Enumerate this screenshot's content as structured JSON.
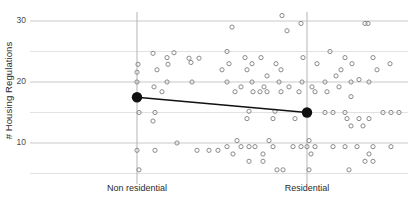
{
  "chart_data": {
    "type": "scatter",
    "title": "",
    "xlabel": "",
    "ylabel": "# Housing Regulations",
    "categories": [
      "Non residential",
      "Residential"
    ],
    "ylim": [
      3,
      32
    ],
    "yticks": [
      10,
      20,
      30
    ],
    "ytick_labels": [
      "10",
      "20",
      "30"
    ],
    "minor_gridlines": [
      5,
      15,
      25
    ],
    "grid": true,
    "legend": "none",
    "marker_style": "open-circle",
    "mean_marker_style": "filled-circle",
    "mean_line": {
      "label": "mean connector",
      "color": "#111111",
      "from": {
        "category": "Non residential",
        "value": 17.5
      },
      "to": {
        "category": "Residential",
        "value": 15.0
      }
    },
    "series": [
      {
        "name": "Non residential",
        "category_center_x": 137,
        "mean": 17.5,
        "points": [
          {
            "jx": 95,
            "y": 29.0
          },
          {
            "jx": 37,
            "y": 24.8
          },
          {
            "jx": 30,
            "y": 24.0
          },
          {
            "jx": 16,
            "y": 24.7
          },
          {
            "jx": 52,
            "y": 23.9
          },
          {
            "jx": 62,
            "y": 23.9
          },
          {
            "jx": 54,
            "y": 23.2
          },
          {
            "jx": 31,
            "y": 22.9
          },
          {
            "jx": 1,
            "y": 22.9
          },
          {
            "jx": 20,
            "y": 22.0
          },
          {
            "jx": 0,
            "y": 21.6
          },
          {
            "jx": 0,
            "y": 20.0
          },
          {
            "jx": 30,
            "y": 20.0
          },
          {
            "jx": 55,
            "y": 20.0
          },
          {
            "jx": 17,
            "y": 19.2
          },
          {
            "jx": 25,
            "y": 18.4
          },
          {
            "jx": 2,
            "y": 15.0
          },
          {
            "jx": 18,
            "y": 15.0
          },
          {
            "jx": 16,
            "y": 13.6
          },
          {
            "jx": 40,
            "y": 10.0
          },
          {
            "jx": 18,
            "y": 8.8
          },
          {
            "jx": 0,
            "y": 8.8
          },
          {
            "jx": 60,
            "y": 8.8
          },
          {
            "jx": 72,
            "y": 8.8
          },
          {
            "jx": 81,
            "y": 8.8
          },
          {
            "jx": 2,
            "y": 5.6
          }
        ]
      },
      {
        "name": "Residential",
        "category_center_x": 307,
        "mean": 15.0,
        "points": [
          {
            "jx": -25,
            "y": 30.9
          },
          {
            "jx": -6,
            "y": 29.6
          },
          {
            "jx": 58,
            "y": 29.6
          },
          {
            "jx": 61,
            "y": 29.6
          },
          {
            "jx": -20,
            "y": 28.4
          },
          {
            "jx": -80,
            "y": 25.0
          },
          {
            "jx": 23,
            "y": 25.0
          },
          {
            "jx": -62,
            "y": 24.0
          },
          {
            "jx": -46,
            "y": 24.0
          },
          {
            "jx": -4,
            "y": 24.0
          },
          {
            "jx": 38,
            "y": 24.0
          },
          {
            "jx": 66,
            "y": 24.0
          },
          {
            "jx": -78,
            "y": 23.0
          },
          {
            "jx": -55,
            "y": 23.0
          },
          {
            "jx": -31,
            "y": 23.0
          },
          {
            "jx": 10,
            "y": 23.0
          },
          {
            "jx": 45,
            "y": 23.0
          },
          {
            "jx": 83,
            "y": 23.0
          },
          {
            "jx": -85,
            "y": 22.0
          },
          {
            "jx": -60,
            "y": 22.0
          },
          {
            "jx": -26,
            "y": 22.0
          },
          {
            "jx": 34,
            "y": 22.0
          },
          {
            "jx": 70,
            "y": 22.0
          },
          {
            "jx": -40,
            "y": 21.0
          },
          {
            "jx": 29,
            "y": 21.0
          },
          {
            "jx": 52,
            "y": 20.4
          },
          {
            "jx": -80,
            "y": 20.0
          },
          {
            "jx": -55,
            "y": 20.0
          },
          {
            "jx": -28,
            "y": 20.0
          },
          {
            "jx": -5,
            "y": 20.0
          },
          {
            "jx": 18,
            "y": 20.0
          },
          {
            "jx": 44,
            "y": 20.0
          },
          {
            "jx": 62,
            "y": 20.0
          },
          {
            "jx": -66,
            "y": 19.2
          },
          {
            "jx": -43,
            "y": 19.2
          },
          {
            "jx": -18,
            "y": 19.2
          },
          {
            "jx": 5,
            "y": 19.2
          },
          {
            "jx": 32,
            "y": 19.2
          },
          {
            "jx": -72,
            "y": 18.4
          },
          {
            "jx": -54,
            "y": 18.4
          },
          {
            "jx": -47,
            "y": 18.4
          },
          {
            "jx": -40,
            "y": 18.4
          },
          {
            "jx": -26,
            "y": 18.4
          },
          {
            "jx": -8,
            "y": 18.4
          },
          {
            "jx": 8,
            "y": 18.4
          },
          {
            "jx": 20,
            "y": 18.4
          },
          {
            "jx": 44,
            "y": 17.6
          },
          {
            "jx": -58,
            "y": 15.2
          },
          {
            "jx": -32,
            "y": 15.2
          },
          {
            "jx": 18,
            "y": 15.0
          },
          {
            "jx": 26,
            "y": 15.0
          },
          {
            "jx": 38,
            "y": 15.0
          },
          {
            "jx": 76,
            "y": 15.0
          },
          {
            "jx": 84,
            "y": 15.0
          },
          {
            "jx": 92,
            "y": 15.0
          },
          {
            "jx": -60,
            "y": 14.0
          },
          {
            "jx": -34,
            "y": 14.0
          },
          {
            "jx": -12,
            "y": 14.0
          },
          {
            "jx": 40,
            "y": 14.0
          },
          {
            "jx": 52,
            "y": 14.0
          },
          {
            "jx": 62,
            "y": 14.0
          },
          {
            "jx": 44,
            "y": 12.8
          },
          {
            "jx": 56,
            "y": 12.8
          },
          {
            "jx": -70,
            "y": 10.4
          },
          {
            "jx": -38,
            "y": 10.4
          },
          {
            "jx": 2,
            "y": 10.4
          },
          {
            "jx": -80,
            "y": 9.4
          },
          {
            "jx": -66,
            "y": 9.4
          },
          {
            "jx": -58,
            "y": 9.4
          },
          {
            "jx": -52,
            "y": 9.4
          },
          {
            "jx": -34,
            "y": 9.4
          },
          {
            "jx": -14,
            "y": 9.4
          },
          {
            "jx": -6,
            "y": 9.4
          },
          {
            "jx": 0,
            "y": 9.4
          },
          {
            "jx": 8,
            "y": 9.4
          },
          {
            "jx": 26,
            "y": 9.4
          },
          {
            "jx": 38,
            "y": 9.4
          },
          {
            "jx": 50,
            "y": 9.4
          },
          {
            "jx": 66,
            "y": 9.4
          },
          {
            "jx": 84,
            "y": 9.4
          },
          {
            "jx": -74,
            "y": 8.2
          },
          {
            "jx": -44,
            "y": 8.2
          },
          {
            "jx": 4,
            "y": 8.2
          },
          {
            "jx": 62,
            "y": 8.2
          },
          {
            "jx": -58,
            "y": 7.0
          },
          {
            "jx": -44,
            "y": 7.0
          },
          {
            "jx": 58,
            "y": 7.0
          },
          {
            "jx": 66,
            "y": 7.0
          },
          {
            "jx": -30,
            "y": 5.6
          },
          {
            "jx": -24,
            "y": 5.6
          },
          {
            "jx": 2,
            "y": 5.6
          },
          {
            "jx": 42,
            "y": 5.6
          }
        ]
      }
    ],
    "colors": {
      "point_stroke": "#8a8a8a",
      "gridline_major": "#c9c9c9",
      "gridline_minor": "#e2e2e2",
      "category_line": "#b5b5b5",
      "mean_marker": "#111111",
      "text": "#2b2b2b"
    }
  }
}
